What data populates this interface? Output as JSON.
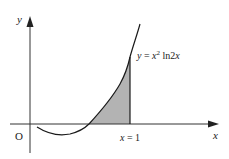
{
  "diagram": {
    "function_label": {
      "prefix": "y = x",
      "exponent": "2",
      "suffix": " ln2x"
    },
    "axis_x_label": "x",
    "axis_y_label": "y",
    "origin_label": "O",
    "vertical_line_label": "x = 1",
    "colors": {
      "stroke": "#1a1a1a",
      "shade": "#b3b3b3",
      "axis": "#333333"
    }
  }
}
